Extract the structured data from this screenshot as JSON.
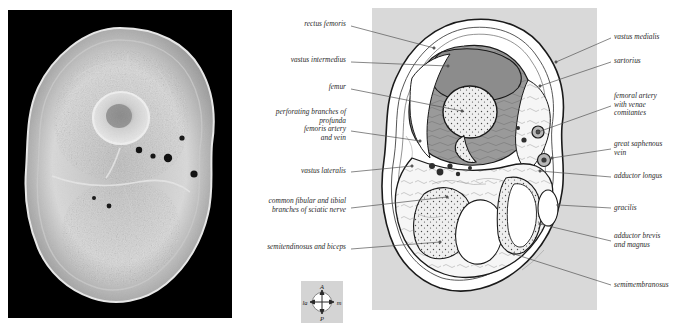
{
  "figure": {
    "type": "anatomical-cross-section-pair"
  },
  "panels": {
    "mri": {
      "name": "axial-mri-thigh",
      "background": "#000000"
    },
    "diagram": {
      "name": "schematic-diagram-thigh",
      "background": "#d9d9d9"
    }
  },
  "labels_left": [
    {
      "id": "rectus-femoris",
      "text": "rectus femoris",
      "x": 228,
      "y": 20,
      "w": 118,
      "lines": 1,
      "lx1": 351,
      "ly1": 26,
      "lx2": 434,
      "ly2": 48
    },
    {
      "id": "vastus-intermedius",
      "text": "vastus intermedius",
      "x": 228,
      "y": 56,
      "w": 118,
      "lines": 1,
      "lx1": 351,
      "ly1": 62,
      "lx2": 448,
      "ly2": 66
    },
    {
      "id": "femur",
      "text": "femur",
      "x": 228,
      "y": 83,
      "w": 118,
      "lines": 1,
      "lx1": 351,
      "ly1": 89,
      "lx2": 462,
      "ly2": 111
    },
    {
      "id": "perforating-branches",
      "text": "perforating branches of\nprofunda\nfemoris artery\nand vein",
      "x": 228,
      "y": 108,
      "w": 118,
      "lines": 4,
      "lx1": 351,
      "ly1": 131,
      "lx2": 420,
      "ly2": 141
    },
    {
      "id": "vastus-lateralis",
      "text": "vastus lateralis",
      "x": 228,
      "y": 167,
      "w": 118,
      "lines": 1,
      "lx1": 351,
      "ly1": 172,
      "lx2": 412,
      "ly2": 166
    },
    {
      "id": "common-fibular-tibial",
      "text": "common fibular and tibial\nbranches of sciatic nerve",
      "x": 228,
      "y": 197,
      "w": 118,
      "lines": 2,
      "lx1": 351,
      "ly1": 208,
      "lx2": 447,
      "ly2": 197
    },
    {
      "id": "semitendinosus-biceps",
      "text": "semitendinosus and biceps",
      "x": 228,
      "y": 243,
      "w": 118,
      "lines": 1,
      "lx1": 351,
      "ly1": 249,
      "lx2": 440,
      "ly2": 242
    }
  ],
  "labels_right": [
    {
      "id": "vastus-medialis",
      "text": "vastus medialis",
      "x": 614,
      "y": 33,
      "w": 76,
      "lines": 1,
      "lx1": 611,
      "ly1": 38,
      "lx2": 556,
      "ly2": 62
    },
    {
      "id": "sartorius",
      "text": "sartorius",
      "x": 614,
      "y": 57,
      "w": 76,
      "lines": 1,
      "lx1": 611,
      "ly1": 62,
      "lx2": 540,
      "ly2": 86
    },
    {
      "id": "femoral-artery",
      "text": "femoral artery\nwith venae\ncomitantes",
      "x": 614,
      "y": 92,
      "w": 76,
      "lines": 3,
      "lx1": 611,
      "ly1": 106,
      "lx2": 538,
      "ly2": 132
    },
    {
      "id": "great-saphenous-vein",
      "text": "great saphenous\nvein",
      "x": 614,
      "y": 140,
      "w": 76,
      "lines": 2,
      "lx1": 611,
      "ly1": 149,
      "lx2": 552,
      "ly2": 158
    },
    {
      "id": "adductor-longus",
      "text": "adductor longus",
      "x": 614,
      "y": 172,
      "w": 76,
      "lines": 1,
      "lx1": 611,
      "ly1": 177,
      "lx2": 540,
      "ly2": 171
    },
    {
      "id": "gracilis",
      "text": "gracilis",
      "x": 614,
      "y": 204,
      "w": 76,
      "lines": 1,
      "lx1": 611,
      "ly1": 208,
      "lx2": 558,
      "ly2": 205
    },
    {
      "id": "adductor-brevis-magnus",
      "text": "adductor brevis\nand magnus",
      "x": 614,
      "y": 232,
      "w": 76,
      "lines": 2,
      "lx1": 611,
      "ly1": 241,
      "lx2": 540,
      "ly2": 224
    },
    {
      "id": "semimembranosus",
      "text": "semimembranosus",
      "x": 614,
      "y": 281,
      "w": 76,
      "lines": 1,
      "lx1": 611,
      "ly1": 285,
      "lx2": 514,
      "ly2": 254
    }
  ],
  "compass": {
    "name": "orientation-compass",
    "anterior": "A",
    "posterior": "P",
    "lateral": "la",
    "medial": "m",
    "background": "#d4d4d4"
  },
  "colors": {
    "page_background": "#ffffff",
    "mri_background": "#000000",
    "diagram_background": "#d9d9d9",
    "muscle_fill": "#9a9a9a",
    "fat_fill": "#f2f2f2",
    "bone_fill": "#ececec",
    "outline": "#1a1a1a",
    "label_text": "#2b2b2b",
    "leader_line": "#555555"
  }
}
